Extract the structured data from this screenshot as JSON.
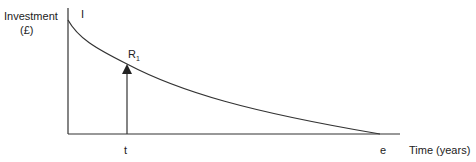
{
  "diagram": {
    "y_axis_label_line1": "Investment",
    "y_axis_label_line2": "(£)",
    "x_axis_label": "Time (years)",
    "initial_label": "I",
    "point_label_main": "R",
    "point_label_sub": "1",
    "t_label": "t",
    "e_label": "e"
  }
}
